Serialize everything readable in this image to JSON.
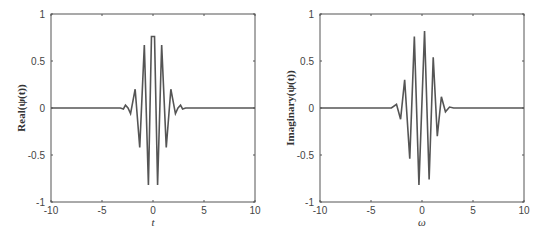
{
  "chart_data": [
    {
      "type": "line",
      "title": "",
      "xlabel": "t",
      "ylabel": "Real(ψ(t))",
      "xlim": [
        -10,
        10
      ],
      "ylim": [
        -1,
        1
      ],
      "xticks": [
        "-10",
        "-5",
        "0",
        "5",
        "10"
      ],
      "yticks": [
        "-1",
        "-0.5",
        "0",
        "0.5",
        "1"
      ],
      "grid": false,
      "series": [
        {
          "name": "Real",
          "color": "#555555",
          "x": [
            -10,
            -3.2,
            -2.9,
            -2.7,
            -2.45,
            -2.2,
            -1.75,
            -1.3,
            -0.85,
            -0.45,
            -0.15,
            0.15,
            0.45,
            0.85,
            1.3,
            1.75,
            2.2,
            2.45,
            2.7,
            2.9,
            3.2,
            10
          ],
          "y": [
            0,
            0,
            -0.01,
            0.03,
            0.0,
            -0.06,
            0.2,
            -0.42,
            0.67,
            -0.82,
            0.76,
            0.76,
            -0.82,
            0.67,
            -0.42,
            0.2,
            -0.06,
            0.0,
            0.03,
            -0.01,
            0,
            0
          ]
        }
      ]
    },
    {
      "type": "line",
      "title": "",
      "xlabel": "ω",
      "ylabel": "Imaginary(ψ(t))",
      "xlim": [
        -10,
        10
      ],
      "ylim": [
        -1,
        1
      ],
      "xticks": [
        "-10",
        "-5",
        "0",
        "5",
        "10"
      ],
      "yticks": [
        "-1",
        "-0.5",
        "0",
        "0.5",
        "1"
      ],
      "grid": false,
      "series": [
        {
          "name": "Imaginary",
          "color": "#555555",
          "x": [
            -10,
            -3.3,
            -3.0,
            -2.5,
            -2.1,
            -1.7,
            -1.2,
            -0.75,
            -0.3,
            0.25,
            0.7,
            1.1,
            1.5,
            1.9,
            2.3,
            2.7,
            3.1,
            10
          ],
          "y": [
            0,
            0,
            0.0,
            0.04,
            -0.12,
            0.3,
            -0.54,
            0.76,
            -0.82,
            0.82,
            -0.76,
            0.54,
            -0.3,
            0.12,
            -0.04,
            0.01,
            0,
            0
          ]
        }
      ]
    }
  ]
}
